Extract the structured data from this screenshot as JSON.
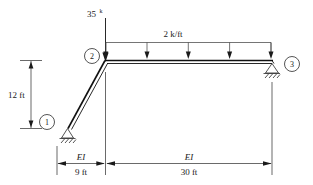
{
  "diagram": {
    "type": "structural-frame-free-body-diagram"
  },
  "loads": {
    "point_load": {
      "value": "35",
      "unit_superscript": "k",
      "direction": "down",
      "applied_at_joint": "2"
    },
    "distributed_load": {
      "label": "2 k/ft",
      "direction": "down",
      "arrow_count": 5,
      "span": "joint-2-to-joint-3"
    }
  },
  "joints": [
    {
      "id": "1",
      "label": "1",
      "support": "pin"
    },
    {
      "id": "2",
      "label": "2",
      "support": "none"
    },
    {
      "id": "3",
      "label": "3",
      "support": "roller"
    }
  ],
  "dimensions": {
    "vertical": {
      "label": "12 ft"
    },
    "left_span": {
      "stiffness": "EI",
      "label": "9 ft"
    },
    "right_span": {
      "stiffness": "EI",
      "label": "30 ft"
    }
  },
  "colors": {
    "member": "#111111",
    "line": "#2a2a2a",
    "text": "#1a1a1a",
    "background": "#ffffff"
  }
}
